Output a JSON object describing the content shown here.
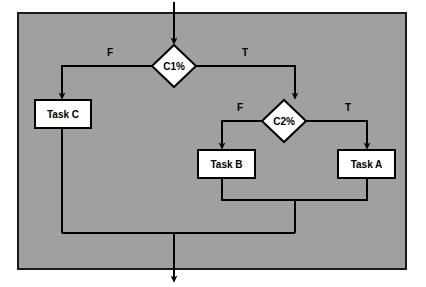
{
  "canvas": {
    "width": 426,
    "height": 287,
    "page_background": "#ffffff",
    "frame_background": "#a0a0a0",
    "frame_border_color": "#1a1a1a",
    "line_color": "#000000",
    "node_fill": "#ffffff",
    "node_stroke": "#000000",
    "text_color": "#000000"
  },
  "diagram": {
    "type": "flowchart",
    "decisions": [
      {
        "id": "c1",
        "label": "C1%",
        "shape": "diamond",
        "cx": 174,
        "cy": 66,
        "rx": 22,
        "ry": 21,
        "true_label": "T",
        "false_label": "F",
        "true_target": "c2",
        "false_target": "task-c"
      },
      {
        "id": "c2",
        "label": "C2%",
        "shape": "diamond",
        "cx": 284,
        "cy": 121,
        "rx": 22,
        "ry": 21,
        "true_label": "T",
        "false_label": "F",
        "true_target": "task-a",
        "false_target": "task-b"
      }
    ],
    "tasks": [
      {
        "id": "task-c",
        "label": "Task C",
        "shape": "rect",
        "x": 35,
        "y": 100,
        "w": 56,
        "h": 28
      },
      {
        "id": "task-b",
        "label": "Task B",
        "shape": "rect",
        "x": 198,
        "y": 150,
        "w": 57,
        "h": 28
      },
      {
        "id": "task-a",
        "label": "Task A",
        "shape": "rect",
        "x": 338,
        "y": 150,
        "w": 57,
        "h": 28
      }
    ],
    "edge_labels": [
      {
        "id": "c1-false",
        "text": "F",
        "x": 110,
        "y": 56
      },
      {
        "id": "c1-true",
        "text": "T",
        "x": 245,
        "y": 56
      },
      {
        "id": "c2-false",
        "text": "F",
        "x": 240,
        "y": 111
      },
      {
        "id": "c2-true",
        "text": "T",
        "x": 348,
        "y": 111
      }
    ],
    "entry": {
      "id": "entry-arrow",
      "x": 174,
      "y_start": 2,
      "y_end": 45
    },
    "exit": {
      "id": "exit-arrow",
      "x": 174,
      "y_start": 233,
      "y_end": 283
    },
    "merge_lines": {
      "task_merge_y": 200,
      "bottom_merge_y": 233,
      "left_branch_x": 62,
      "right_branch_x": 295,
      "c2_false_branch_x": 222,
      "c2_true_branch_x": 367
    }
  },
  "frame": {
    "id": "diagram-frame",
    "x": 17,
    "y": 12,
    "width": 390,
    "height": 258,
    "border_width": 2
  }
}
